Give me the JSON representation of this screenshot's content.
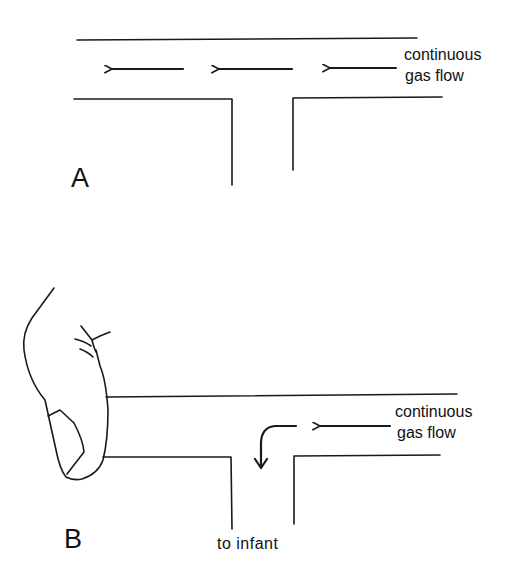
{
  "diagram": {
    "colors": {
      "ink": "#1a1a1a",
      "background": "#ffffff"
    },
    "panels": [
      {
        "id": "A",
        "label": "A",
        "flow_label_line1": "continuous",
        "flow_label_line2": "gas flow",
        "arrows": [
          "left-arrow",
          "left-arrow",
          "left-arrow"
        ],
        "note": "open T-piece: gas flows out left end"
      },
      {
        "id": "B",
        "label": "B",
        "flow_label_line1": "continuous",
        "flow_label_line2": "gas flow",
        "outlet_label": "to infant",
        "arrows": [
          "left-arrow",
          "curved-down-arrow"
        ],
        "note": "finger occludes left end: gas diverted down to infant"
      }
    ]
  }
}
